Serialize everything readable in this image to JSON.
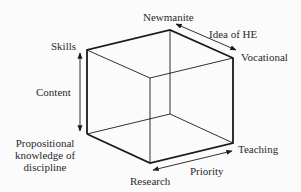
{
  "diagram": {
    "type": "3d-cube-axes",
    "axes": [
      {
        "name": "Content",
        "from": "Propositional knowledge of discipline",
        "to": "Skills"
      },
      {
        "name": "Idea of HE",
        "from": "Newmanite",
        "to": "Vocational"
      },
      {
        "name": "Priority",
        "from": "Research",
        "to": "Teaching"
      }
    ]
  },
  "labels": {
    "newmanite": "Newmanite",
    "idea_of_he": "Idea of HE",
    "vocational": "Vocational",
    "skills": "Skills",
    "content": "Content",
    "propositional_line1": "Propositional",
    "propositional_line2": "knowledge of",
    "propositional_line3": "discipline",
    "teaching": "Teaching",
    "priority": "Priority",
    "research": "Research"
  },
  "colors": {
    "line": "#1a1a1a",
    "background": "#fbfbfb"
  }
}
